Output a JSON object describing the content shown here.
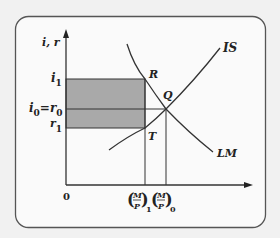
{
  "diagram": {
    "type": "IS-LM",
    "axes": {
      "y_label": "i, r",
      "origin_label": "0"
    },
    "y_ticks": {
      "i1": {
        "base": "i",
        "sub": "1"
      },
      "i0_r0": {
        "base1": "i",
        "sub1": "0",
        "eq": "=",
        "base2": "r",
        "sub2": "0"
      },
      "r1": {
        "base": "r",
        "sub": "1"
      }
    },
    "x_ticks": {
      "mp1": {
        "num": "M",
        "den": "P",
        "sub": "1"
      },
      "mp0": {
        "num": "M",
        "den": "P",
        "sub": "0"
      }
    },
    "curves": {
      "is_label": "IS",
      "lm_label": "LM"
    },
    "points": {
      "R": "R",
      "Q": "Q",
      "T": "T"
    },
    "colors": {
      "background": "#f1f1f1",
      "panel": "#fafafa",
      "shade": "#a9a9a9",
      "line": "#333333"
    }
  }
}
